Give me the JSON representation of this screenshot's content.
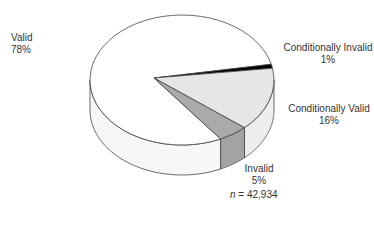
{
  "chart_data": {
    "type": "pie",
    "style": "3d",
    "title": "",
    "categories": [
      "Valid",
      "Conditionally Invalid",
      "Conditionally Valid",
      "Invalid"
    ],
    "values": [
      78,
      1,
      16,
      5
    ],
    "unit": "%",
    "colors": [
      "#ffffff",
      "#000000",
      "#e6e6e6",
      "#aaaaaa"
    ],
    "side_colors": [
      "#f7f7f7",
      "#000000",
      "#eeeeee",
      "#a3a3a3"
    ],
    "sample_size": "42,934",
    "legend": "none (direct labels)"
  },
  "labels": {
    "valid": {
      "name": "Valid",
      "pct": "78%"
    },
    "cond_invalid": {
      "name": "Conditionally Invalid",
      "pct": "1%"
    },
    "cond_valid": {
      "name": "Conditionally Valid",
      "pct": "16%"
    },
    "invalid": {
      "name": "Invalid",
      "pct": "5%"
    }
  },
  "footer": {
    "n_symbol": "n",
    "n_text": " = 42,934"
  }
}
